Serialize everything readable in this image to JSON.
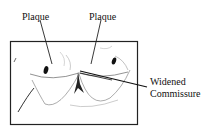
{
  "diagram": {
    "labels": {
      "plaque_left": "Plaque",
      "plaque_right": "Plaque",
      "commissure_line1": "Widened",
      "commissure_line2": "Commissure"
    }
  }
}
